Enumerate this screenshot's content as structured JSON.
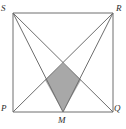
{
  "figure": {
    "shape_name": "square",
    "fill_color": "#a8a8a8",
    "line_color": "#6e6e6e",
    "background_color": "#ffffff",
    "stroke_width": 1,
    "labels": {
      "top_left": "S",
      "top_right": "R",
      "bottom_left": "P",
      "bottom_right": "Q",
      "bottom_mid": "M"
    },
    "points": {
      "S": {
        "x": 13,
        "y": 13
      },
      "R": {
        "x": 113,
        "y": 13
      },
      "P": {
        "x": 13,
        "y": 112
      },
      "Q": {
        "x": 113,
        "y": 112
      },
      "M": {
        "x": 63,
        "y": 112
      }
    },
    "shaded_region": {
      "name": "kite",
      "vertices": [
        {
          "x": 63,
          "y": 63
        },
        {
          "x": 81,
          "y": 80
        },
        {
          "x": 63,
          "y": 112
        },
        {
          "x": 45,
          "y": 80
        }
      ]
    },
    "segments": [
      {
        "name": "side-SR",
        "from": "S",
        "to": "R"
      },
      {
        "name": "side-RQ",
        "from": "R",
        "to": "Q"
      },
      {
        "name": "side-QP",
        "from": "Q",
        "to": "P"
      },
      {
        "name": "side-PS",
        "from": "P",
        "to": "S"
      },
      {
        "name": "diagonal-SQ",
        "from": "S",
        "to": "Q"
      },
      {
        "name": "diagonal-RP",
        "from": "R",
        "to": "P"
      },
      {
        "name": "segment-SM",
        "from": "S",
        "to": "M"
      },
      {
        "name": "segment-RM",
        "from": "R",
        "to": "M"
      }
    ]
  }
}
